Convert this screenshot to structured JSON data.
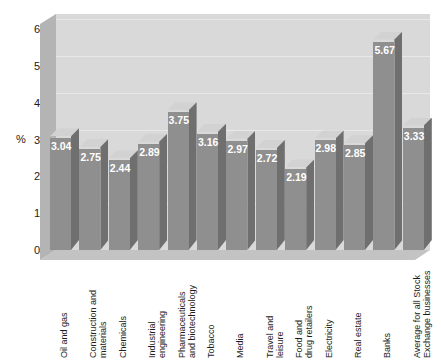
{
  "chart_data": {
    "type": "bar",
    "title": "",
    "xlabel": "",
    "ylabel": "%",
    "ylim": [
      0,
      6
    ],
    "yticks": [
      "0",
      "1",
      "2",
      "3",
      "4",
      "5",
      "6"
    ],
    "grid": true,
    "legend": "none",
    "style": "3d-column",
    "categories": [
      "Oil and gas",
      "Construction and materials",
      "Chemicals",
      "Industrial engineering",
      "Pharmaceuticals and biotechnology",
      "Tobacco",
      "Media",
      "Travel and leisure",
      "Food and drug retailers",
      "Electricity",
      "Real estate",
      "Banks",
      "Average for all Stock Exchange businesses"
    ],
    "category_lines": [
      [
        "Oil and gas"
      ],
      [
        "Construction and",
        "materials"
      ],
      [
        "Chemicals"
      ],
      [
        "Industrial",
        "engineering"
      ],
      [
        "Pharmaceuticals",
        "and biotechnology"
      ],
      [
        "Tobacco"
      ],
      [
        "Media"
      ],
      [
        "Travel and",
        "leisure"
      ],
      [
        "Food and",
        "drug retailers"
      ],
      [
        "Electricity"
      ],
      [
        "Real estate"
      ],
      [
        "Banks"
      ],
      [
        "Average for all Stock",
        "Exchange businesses"
      ]
    ],
    "values": [
      3.04,
      2.75,
      2.44,
      2.89,
      3.75,
      3.16,
      2.97,
      2.72,
      2.19,
      2.98,
      2.85,
      5.67,
      3.33
    ],
    "value_labels": [
      "3.04",
      "2.75",
      "2.44",
      "2.89",
      "3.75",
      "3.16",
      "2.97",
      "2.72",
      "2.19",
      "2.98",
      "2.85",
      "5.67",
      "3.33"
    ],
    "colors": {
      "bar_front": "#8f8f8f",
      "bar_side": "#6f6f6f",
      "bar_top": "#d2d2d2",
      "back_wall": "#d9d9d9",
      "left_wall": "#b4b4b4",
      "floor": "#c3c3c3",
      "gridline": "#e8e8e8",
      "value_label": "#ffffff",
      "axis_text": "#1c1c1c"
    }
  }
}
